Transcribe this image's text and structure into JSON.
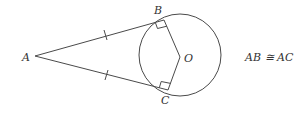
{
  "diagram": {
    "type": "geometry",
    "points": {
      "A": {
        "label": "A",
        "x": 35,
        "y": 56
      },
      "B": {
        "label": "B",
        "x": 164,
        "y": 20
      },
      "C": {
        "label": "C",
        "x": 168,
        "y": 90
      },
      "O": {
        "label": "O",
        "x": 180,
        "y": 57
      }
    },
    "circle": {
      "center": "O",
      "cx": 180,
      "cy": 55,
      "r": 41
    },
    "segments": [
      "AB",
      "AC",
      "OB",
      "OC"
    ],
    "right_angles": [
      "ABO",
      "ACO"
    ],
    "congruence_marks": [
      "AB",
      "AC"
    ],
    "statement": "AB ≅ AC",
    "colors": {
      "stroke": "#4a4a4a",
      "text": "#333333",
      "background": "#ffffff"
    }
  }
}
